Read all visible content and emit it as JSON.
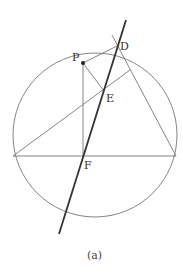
{
  "figure": {
    "caption": "(a)",
    "colors": {
      "thin_line": "#777777",
      "thick_line": "#333333",
      "label": "#333333",
      "background": "#ffffff"
    },
    "circle": {
      "cx": 95,
      "cy": 135,
      "r": 82
    },
    "points": {
      "P": {
        "label": "P",
        "x": 83,
        "y": 63
      },
      "D": {
        "label": "D",
        "x": 117,
        "y": 46
      },
      "E": {
        "label": "E",
        "x": 104,
        "y": 91
      },
      "F": {
        "label": "F",
        "x": 83,
        "y": 156
      }
    },
    "labels": {
      "P": "P",
      "D": "D",
      "E": "E",
      "F": "F"
    }
  }
}
